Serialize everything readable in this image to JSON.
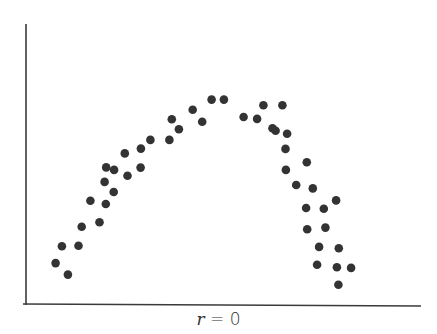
{
  "chart_data": {
    "type": "scatter",
    "title": "",
    "xlabel": "",
    "ylabel": "",
    "caption": "r = 0",
    "caption_var": "r",
    "caption_rest": " = 0",
    "xlim": [
      0,
      100
    ],
    "ylim": [
      0,
      100
    ],
    "grid": false,
    "legend": null,
    "axes": {
      "show_ticks": false,
      "show_tick_labels": false
    },
    "marker_color": "#333333",
    "marker_radius": 4.3,
    "series": [
      {
        "name": "points",
        "points": [
          {
            "x": 7.5,
            "y": 14.6
          },
          {
            "x": 10.6,
            "y": 10.5
          },
          {
            "x": 9.1,
            "y": 20.6
          },
          {
            "x": 13.3,
            "y": 20.8
          },
          {
            "x": 14.1,
            "y": 27.6
          },
          {
            "x": 18.6,
            "y": 29.2
          },
          {
            "x": 16.3,
            "y": 36.9
          },
          {
            "x": 20.2,
            "y": 35.7
          },
          {
            "x": 22.2,
            "y": 40.0
          },
          {
            "x": 19.9,
            "y": 43.6
          },
          {
            "x": 22.3,
            "y": 47.9
          },
          {
            "x": 20.3,
            "y": 48.8
          },
          {
            "x": 25.7,
            "y": 45.8
          },
          {
            "x": 29.0,
            "y": 48.7
          },
          {
            "x": 25.0,
            "y": 53.8
          },
          {
            "x": 29.1,
            "y": 55.5
          },
          {
            "x": 31.5,
            "y": 58.6
          },
          {
            "x": 36.3,
            "y": 58.6
          },
          {
            "x": 38.7,
            "y": 62.4
          },
          {
            "x": 36.9,
            "y": 66.0
          },
          {
            "x": 42.2,
            "y": 69.4
          },
          {
            "x": 44.6,
            "y": 65.1
          },
          {
            "x": 47.0,
            "y": 73.0
          },
          {
            "x": 50.1,
            "y": 73.0
          },
          {
            "x": 55.1,
            "y": 66.8
          },
          {
            "x": 58.5,
            "y": 66.1
          },
          {
            "x": 60.1,
            "y": 71.0
          },
          {
            "x": 64.9,
            "y": 71.0
          },
          {
            "x": 63.2,
            "y": 61.9
          },
          {
            "x": 62.4,
            "y": 62.8
          },
          {
            "x": 66.1,
            "y": 60.8
          },
          {
            "x": 65.7,
            "y": 55.4
          },
          {
            "x": 71.1,
            "y": 50.6
          },
          {
            "x": 65.8,
            "y": 47.9
          },
          {
            "x": 68.4,
            "y": 42.5
          },
          {
            "x": 72.6,
            "y": 41.3
          },
          {
            "x": 78.5,
            "y": 37.0
          },
          {
            "x": 70.9,
            "y": 34.3
          },
          {
            "x": 75.4,
            "y": 34.0
          },
          {
            "x": 71.2,
            "y": 26.7
          },
          {
            "x": 75.8,
            "y": 27.3
          },
          {
            "x": 74.2,
            "y": 20.4
          },
          {
            "x": 79.2,
            "y": 19.9
          },
          {
            "x": 73.7,
            "y": 14.0
          },
          {
            "x": 78.7,
            "y": 13.1
          },
          {
            "x": 82.3,
            "y": 12.9
          },
          {
            "x": 79.1,
            "y": 6.9
          }
        ]
      }
    ]
  },
  "layout": {
    "plot_left": 26,
    "plot_right": 421,
    "plot_top": 24,
    "plot_bottom": 304,
    "axis_color": "#3a3a3a"
  }
}
